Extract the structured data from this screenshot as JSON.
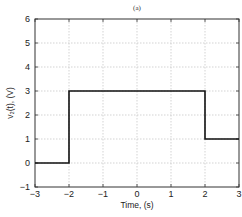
{
  "chart_data": {
    "type": "line",
    "title": "(a)",
    "xlabel": "Time, (s)",
    "ylabel": "v₂(t), (V)",
    "xlim": [
      -3,
      3
    ],
    "ylim": [
      -1,
      6
    ],
    "xticks": [
      -3,
      -2,
      -1,
      0,
      1,
      2,
      3
    ],
    "yticks": [
      -1,
      0,
      1,
      2,
      3,
      4,
      5,
      6
    ],
    "grid": true,
    "legend": null,
    "series": [
      {
        "name": "v2(t)",
        "x": [
          -3,
          -2,
          -2,
          2,
          2,
          3
        ],
        "y": [
          0,
          0,
          3,
          3,
          1,
          1
        ]
      }
    ]
  },
  "colors": {
    "line": "#111111",
    "grid": "#c8c8c8",
    "axes": "#333333"
  }
}
